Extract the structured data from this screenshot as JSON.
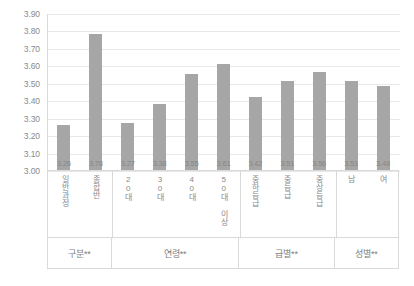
{
  "chart_data": {
    "type": "bar",
    "title": "",
    "subtitle": "",
    "xlabel": "",
    "ylabel": "",
    "ylim": [
      3.0,
      3.9
    ],
    "ytick_step": 0.1,
    "grid": true,
    "legend": "none",
    "bar_color": "#a6a6a6",
    "ytick_labels": [
      "3.90",
      "3.80",
      "3.70",
      "3.60",
      "3.50",
      "3.40",
      "3.30",
      "3.20",
      "3.10",
      "3.00"
    ],
    "ytick_values": [
      3.9,
      3.8,
      3.7,
      3.6,
      3.5,
      3.4,
      3.3,
      3.2,
      3.1,
      3.0
    ],
    "categories": [
      "일반과정",
      "종합반",
      "20대",
      "30대",
      "40대",
      "50대 이상",
      "중하등급",
      "중등급",
      "중상등급",
      "남",
      "여"
    ],
    "values": [
      3.26,
      3.78,
      3.27,
      3.38,
      3.55,
      3.61,
      3.42,
      3.51,
      3.56,
      3.51,
      3.48
    ],
    "data_labels": [
      "3.26",
      "3.78",
      "3.27",
      "3.38",
      "3.55",
      "3.61",
      "3.42",
      "3.51",
      "3.56",
      "3.51",
      "3.48"
    ],
    "groups": [
      {
        "label": "구분**",
        "span": 2
      },
      {
        "label": "연령**",
        "span": 4
      },
      {
        "label": "급별**",
        "span": 3
      },
      {
        "label": "성별**",
        "span": 2
      }
    ]
  }
}
